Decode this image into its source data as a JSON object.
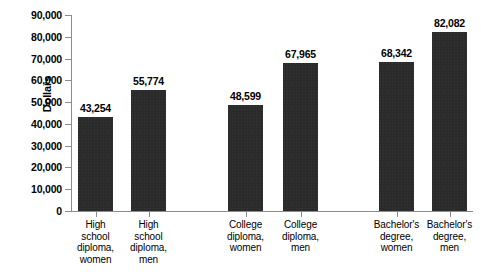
{
  "chart_data": {
    "type": "bar",
    "title": "",
    "xlabel": "",
    "ylabel": "Dollars",
    "ylim": [
      0,
      90000
    ],
    "ytick_labels": [
      "90,000",
      "80,000",
      "70,000",
      "60,000",
      "50,000",
      "40,000",
      "30,000",
      "20,000",
      "10,000",
      "0"
    ],
    "ytick_values": [
      90000,
      80000,
      70000,
      60000,
      50000,
      40000,
      30000,
      20000,
      10000,
      0
    ],
    "grid": false,
    "legend": "none",
    "bar_color": "#2b2b2b",
    "axis_color": "#8c8c8c",
    "categories": [
      "High school diploma, women",
      "High school diploma, men",
      "College diploma, women",
      "College diploma, men",
      "Bachelor's degree, women",
      "Bachelor's degree, men"
    ],
    "category_lines": [
      [
        "High",
        "school",
        "diploma,",
        "women"
      ],
      [
        "High",
        "school",
        "diploma,",
        "men"
      ],
      [
        "College",
        "diploma,",
        "women"
      ],
      [
        "College",
        "diploma,",
        "men"
      ],
      [
        "Bachelor's",
        "degree,",
        "women"
      ],
      [
        "Bachelor's",
        "degree,",
        "men"
      ]
    ],
    "values": [
      43254,
      55774,
      48599,
      67965,
      68342,
      82082
    ],
    "value_labels": [
      "43,254",
      "55,774",
      "48,599",
      "67,965",
      "68,342",
      "82,082"
    ]
  }
}
